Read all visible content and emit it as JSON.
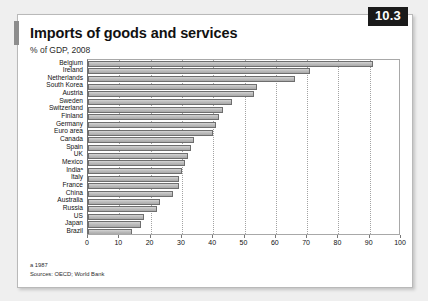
{
  "badge": {
    "number": "10.3"
  },
  "header": {
    "title": "Imports of goods and services",
    "subtitle": "% of GDP, 2008"
  },
  "footnotes": {
    "note_a": "a 1987",
    "sources": "Sources: OECD; World Bank"
  },
  "colors": {
    "bar_fill": "#bdbdbd",
    "bar_stroke": "#6e6e6e",
    "badge_bg": "#1a1a1a",
    "grid": "#a3a3a3",
    "card_bg": "#ffffff",
    "page_bg": "#efefef"
  },
  "chart_data": {
    "type": "bar",
    "orientation": "horizontal",
    "title": "Imports of goods and services",
    "subtitle": "% of GDP, 2008",
    "xlabel": "",
    "ylabel": "",
    "xlim": [
      0,
      100
    ],
    "xticks": [
      0,
      10,
      20,
      30,
      40,
      50,
      60,
      70,
      80,
      90,
      100
    ],
    "grid": true,
    "grid_axis": "x",
    "legend": false,
    "categories": [
      "Belgium",
      "Ireland",
      "Netherlands",
      "South Korea",
      "Austria",
      "Sweden",
      "Switzerland",
      "Finland",
      "Germany",
      "Euro area",
      "Canada",
      "Spain",
      "UK",
      "Mexico",
      "India",
      "Italy",
      "France",
      "China",
      "Australia",
      "Russia",
      "US",
      "Japan",
      "Brazil"
    ],
    "category_labels": [
      "Belgium",
      "Ireland",
      "Netherlands",
      "South Korea",
      "Austria",
      "Sweden",
      "Switzerland",
      "Finland",
      "Germany",
      "Euro area",
      "Canada",
      "Spain",
      "UK",
      "Mexico",
      "Indiaᵃ",
      "Italy",
      "France",
      "China",
      "Australia",
      "Russia",
      "US",
      "Japan",
      "Brazil"
    ],
    "values": [
      91,
      71,
      66,
      54,
      53,
      46,
      43,
      42,
      41,
      40,
      34,
      33,
      32,
      31,
      30,
      29,
      29,
      27,
      23,
      22,
      18,
      17,
      14
    ],
    "units": "% of GDP",
    "notes": [
      "a 1987"
    ],
    "sources": "OECD; World Bank"
  }
}
